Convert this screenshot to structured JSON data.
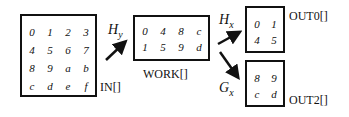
{
  "in": {
    "label": "IN[]",
    "cells": [
      [
        "0",
        "1",
        "2",
        "3"
      ],
      [
        "4",
        "5",
        "6",
        "7"
      ],
      [
        "8",
        "9",
        "a",
        "b"
      ],
      [
        "c",
        "d",
        "e",
        "f"
      ]
    ]
  },
  "work": {
    "label": "WORK[]",
    "cells": [
      [
        "0",
        "4",
        "8",
        "c"
      ],
      [
        "1",
        "5",
        "9",
        "d"
      ]
    ]
  },
  "out0": {
    "label": "OUT0[]",
    "cells": [
      [
        "0",
        "1"
      ],
      [
        "4",
        "5"
      ]
    ]
  },
  "out2": {
    "label": "OUT2[]",
    "cells": [
      [
        "8",
        "9"
      ],
      [
        "c",
        "d"
      ]
    ]
  },
  "ops": {
    "hy_main": "H",
    "hy_sub": "y",
    "hx_main": "H",
    "hx_sub": "x",
    "gx_main": "G",
    "gx_sub": "x"
  }
}
